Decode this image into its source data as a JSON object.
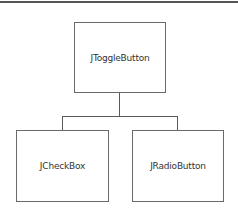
{
  "diagram": {
    "type": "class-hierarchy",
    "root": {
      "label": "JToggleButton"
    },
    "children": [
      {
        "label": "JCheckBox"
      },
      {
        "label": "JRadioButton"
      }
    ],
    "colors": {
      "border": "#6a6a6a",
      "line": "#5a5a5a",
      "text": "#333333",
      "background": "#ffffff"
    }
  }
}
